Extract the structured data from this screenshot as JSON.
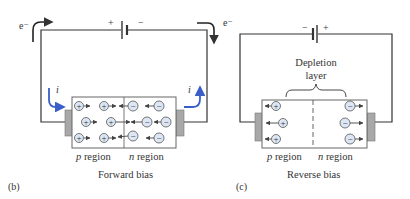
{
  "colors": {
    "wire": "#333333",
    "current_arrow": "#3b5fc9",
    "ion_fill": "#dde6f4",
    "ion_stroke": "#555555",
    "contact": "#a8a8a8",
    "box_stroke": "#666666"
  },
  "panel_b": {
    "caption": "(b)",
    "title": "Forward bias",
    "battery_plus": "+",
    "battery_minus": "−",
    "electron_left": "e⁻",
    "electron_right": "e⁻",
    "current_left": "i",
    "current_right": "i",
    "p_region_label": "p region",
    "n_region_label": "n region",
    "holes": [
      "+",
      "+",
      "+",
      "+",
      "+",
      "+"
    ],
    "electrons": [
      "−",
      "−",
      "−",
      "−",
      "−",
      "−"
    ]
  },
  "panel_c": {
    "caption": "(c)",
    "title": "Reverse bias",
    "battery_plus": "+",
    "battery_minus": "−",
    "depletion_label_line1": "Depletion",
    "depletion_label_line2": "layer",
    "p_region_label": "p region",
    "n_region_label": "n region",
    "holes": [
      "+",
      "+",
      "+"
    ],
    "electrons": [
      "−",
      "−",
      "−"
    ]
  }
}
